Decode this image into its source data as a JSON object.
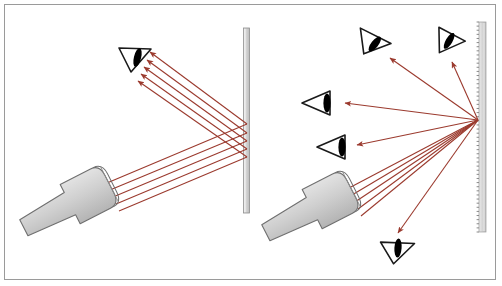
{
  "figure": {
    "width": 502,
    "height": 286,
    "background_color": "#ffffff",
    "frame_color": "#9a9a9a"
  },
  "colors": {
    "ray": "#9b3a2e",
    "ray_dark": "#8d3226",
    "surface_fill": "#d4d4d4",
    "surface_edge": "#8d8d8d",
    "flashlight_fill": "#cccccc",
    "flashlight_edge": "#6f6f6f",
    "eye_outline": "#1a1a1a",
    "eye_pupil": "#000000"
  },
  "panels": [
    {
      "id": "left-panel",
      "name": "specular-reflection",
      "label": "Smooth surface: specular reflection",
      "surface": {
        "name": "smooth-mirror-surface",
        "type": "smooth",
        "x": 246,
        "y_top": 28,
        "y_bottom": 213,
        "thickness": 6
      },
      "flashlight": {
        "name": "flashlight-left",
        "head_x": 88,
        "head_y": 195,
        "angle_deg": -27
      },
      "eyes": [
        {
          "name": "eye-left-observer",
          "x": 133,
          "y": 58,
          "rotation_deg": 0,
          "orientation": "down-right"
        }
      ],
      "incident_rays": 5,
      "reflected_rays": 5
    },
    {
      "id": "right-panel",
      "name": "diffuse-reflection",
      "label": "Rough surface: diffuse reflection",
      "surface": {
        "name": "rough-scattering-surface",
        "type": "rough",
        "x": 482,
        "y_top": 22,
        "y_bottom": 232,
        "thickness": 7,
        "teeth": 52
      },
      "flashlight": {
        "name": "flashlight-right",
        "head_x": 330,
        "head_y": 200,
        "angle_deg": -27
      },
      "scatter_point": {
        "x": 478,
        "y": 120
      },
      "eyes": [
        {
          "name": "eye-upper-left-observer",
          "x": 372,
          "y": 43,
          "rotation_deg": 20,
          "orientation": "down-right"
        },
        {
          "name": "eye-upper-right-observer",
          "x": 450,
          "y": 42,
          "rotation_deg": 10,
          "orientation": "down-right"
        },
        {
          "name": "eye-mid-left-observer",
          "x": 318,
          "y": 103,
          "rotation_deg": 0,
          "orientation": "left"
        },
        {
          "name": "eye-lower-left-observer",
          "x": 333,
          "y": 147,
          "rotation_deg": 0,
          "orientation": "left"
        },
        {
          "name": "eye-bottom-observer",
          "x": 398,
          "y": 248,
          "rotation_deg": -25,
          "orientation": "up-right"
        }
      ],
      "incident_rays": 5,
      "scattered_rays": 5
    }
  ]
}
